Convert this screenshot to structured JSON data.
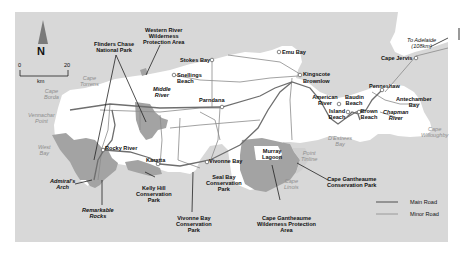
{
  "map": {
    "title": "Kangaroo Island",
    "compass": {
      "label": "N"
    },
    "scale": {
      "start": "0",
      "end": "20",
      "unit": "km"
    },
    "towns": [
      {
        "name": "Emu Bay"
      },
      {
        "name": "Stokes Bay"
      },
      {
        "name": "Snellings Beach"
      },
      {
        "name": "Kingscote"
      },
      {
        "name": "Brownlow"
      },
      {
        "name": "Parndana"
      },
      {
        "name": "Penneshaw"
      },
      {
        "name": "Cape Jervis"
      },
      {
        "name": "American River"
      },
      {
        "name": "Baudin Beach"
      },
      {
        "name": "Island Beach"
      },
      {
        "name": "Brown Beach"
      },
      {
        "name": "Rocky River"
      },
      {
        "name": "Karatta"
      },
      {
        "name": "Vivonne Bay"
      }
    ],
    "labels": {
      "flinders": "Flinders Chase\nNational Park",
      "western_river": "Western River\nWilderness\nProtection Area",
      "middle_river": "Middle\nRiver",
      "chapman_river": "Chapman\nRiver",
      "antechamber": "Antechamber\nBay",
      "to_adelaide": "To Adelaide\n(108km)",
      "murray_lagoon": "Murray\nLagoon",
      "admirals_arch": "Admiral's\nArch",
      "remarkable_rocks": "Remarkable\nRocks",
      "kelly_hill": "Kelly Hill\nConservation\nPark",
      "vivonne_bay_cp": "Vivonne Bay\nConservation\nPark",
      "seal_bay": "Seal Bay\nConservation\nPark",
      "cape_gantheaume_wpa": "Cape Gantheaume\nWilderness Protection\nArea",
      "cape_gantheaume_cp": "Cape Gantheaume\nConservation Park"
    },
    "sea_labels": {
      "cape_torrens": "Cape\nTorrens",
      "cape_borda": "Cape\nBorda",
      "vennachar_point": "Vennachar\nPoint",
      "west_bay": "West\nBay",
      "destrees_bay": "D'Estrees\nBay",
      "point_tinline": "Point\nTinline",
      "cape_linois": "Cape\nLinois",
      "cape_willoughby": "Cape\nWilloughby"
    },
    "legend": {
      "main_road": "Main Road",
      "minor_road": "Minor Road"
    },
    "colors": {
      "sea": "#d7d7d7",
      "land": "#ffffff",
      "park": "#a3a3a3",
      "main_road": "#6e6e6e",
      "minor_road": "#8a8a8a"
    }
  }
}
